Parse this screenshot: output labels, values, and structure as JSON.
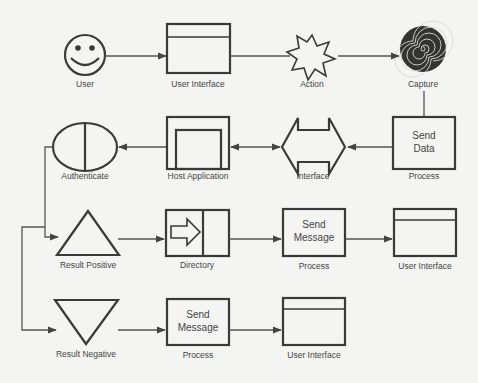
{
  "diagram": {
    "rows": [
      {
        "nodes": [
          {
            "id": "user",
            "shape": "smiley-face",
            "label": "User"
          },
          {
            "id": "ui1",
            "shape": "window",
            "label": "User Interface"
          },
          {
            "id": "action",
            "shape": "eight-point-star",
            "label": "Action"
          },
          {
            "id": "capture",
            "shape": "spiral",
            "label": "Capture"
          }
        ]
      },
      {
        "nodes": [
          {
            "id": "authenticate",
            "shape": "split-ellipse",
            "label": "Authenticate"
          },
          {
            "id": "host",
            "shape": "nested-box",
            "label": "Host Application"
          },
          {
            "id": "interface",
            "shape": "double-arrow",
            "label": "Interface"
          },
          {
            "id": "senddata",
            "shape": "box",
            "text_line1": "Send",
            "text_line2": "Data",
            "label": "Process"
          }
        ]
      },
      {
        "nodes": [
          {
            "id": "positive",
            "shape": "triangle-up",
            "label": "Result Positive"
          },
          {
            "id": "directory",
            "shape": "arrow-box",
            "label": "Directory"
          },
          {
            "id": "sendmsg1",
            "shape": "box",
            "text_line1": "Send",
            "text_line2": "Message",
            "label": "Process"
          },
          {
            "id": "ui2",
            "shape": "window",
            "label": "User Interface"
          }
        ]
      },
      {
        "nodes": [
          {
            "id": "negative",
            "shape": "triangle-down",
            "label": "Result Negative"
          },
          {
            "id": "sendmsg2",
            "shape": "box",
            "text_line1": "Send",
            "text_line2": "Message",
            "label": "Process"
          },
          {
            "id": "ui3",
            "shape": "window",
            "label": "User Interface"
          }
        ]
      }
    ],
    "edges": [
      {
        "from": "user",
        "to": "ui1"
      },
      {
        "from": "ui1",
        "to": "action"
      },
      {
        "from": "action",
        "to": "capture"
      },
      {
        "from": "capture",
        "to": "senddata"
      },
      {
        "from": "senddata",
        "to": "interface"
      },
      {
        "from": "interface",
        "to": "host"
      },
      {
        "from": "host",
        "to": "authenticate"
      },
      {
        "from": "authenticate",
        "to": "positive"
      },
      {
        "from": "authenticate",
        "to": "negative"
      },
      {
        "from": "positive",
        "to": "directory"
      },
      {
        "from": "directory",
        "to": "sendmsg1"
      },
      {
        "from": "sendmsg1",
        "to": "ui2"
      },
      {
        "from": "negative",
        "to": "sendmsg2"
      },
      {
        "from": "sendmsg2",
        "to": "ui3"
      }
    ],
    "colors": {
      "stroke": "#3a3a3a",
      "background": "#f4f4f2"
    }
  }
}
